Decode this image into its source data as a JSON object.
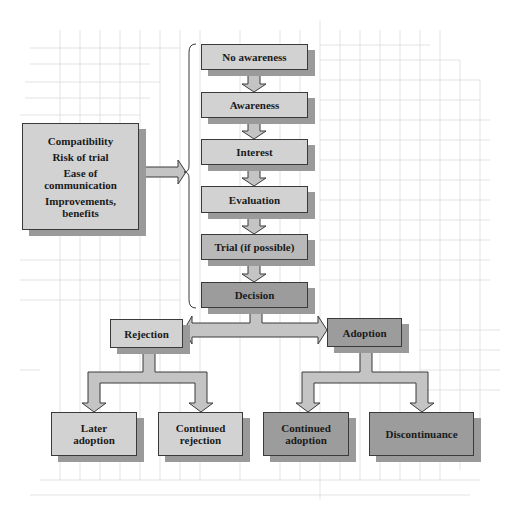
{
  "diagram": {
    "type": "flowchart",
    "factors_box": {
      "items": [
        "Compatibility",
        "Risk of trial",
        "Ease of communication",
        "Improvements, benefits"
      ],
      "lines": [
        "Compatibility",
        "Risk of trial",
        "Ease of",
        "communication",
        "Improvements,",
        "benefits"
      ]
    },
    "stages": [
      {
        "label": "No awareness"
      },
      {
        "label": "Awareness"
      },
      {
        "label": "Interest"
      },
      {
        "label": "Evaluation"
      },
      {
        "label": "Trial (if possible)"
      },
      {
        "label": "Decision"
      }
    ],
    "outcomes": {
      "rejection": {
        "label": "Rejection"
      },
      "adoption": {
        "label": "Adoption"
      }
    },
    "results": {
      "later_adoption": {
        "lines": [
          "Later",
          "adoption"
        ]
      },
      "continued_rejection": {
        "lines": [
          "Continued",
          "rejection"
        ]
      },
      "continued_adoption": {
        "lines": [
          "Continued",
          "adoption"
        ]
      },
      "discontinuance": {
        "lines": [
          "Discontinuance"
        ]
      }
    },
    "edges": [
      {
        "from": "factors_box",
        "to": "stages (bracket)"
      },
      {
        "from": "No awareness",
        "to": "Awareness"
      },
      {
        "from": "Awareness",
        "to": "Interest"
      },
      {
        "from": "Interest",
        "to": "Evaluation"
      },
      {
        "from": "Evaluation",
        "to": "Trial (if possible)"
      },
      {
        "from": "Trial (if possible)",
        "to": "Decision"
      },
      {
        "from": "Decision",
        "to": "Rejection"
      },
      {
        "from": "Decision",
        "to": "Adoption"
      },
      {
        "from": "Rejection",
        "to": "Later adoption"
      },
      {
        "from": "Rejection",
        "to": "Continued rejection"
      },
      {
        "from": "Adoption",
        "to": "Continued adoption"
      },
      {
        "from": "Adoption",
        "to": "Discontinuance"
      }
    ],
    "colors": {
      "box_light": "#d2d2d2",
      "box_mid": "#b9b9b9",
      "box_dark": "#9c9c9c",
      "arrow_fill": "#c4c4c4",
      "shadow": "#9a9a9a",
      "grid": "#d8d8d8",
      "border": "#3a3a3a"
    }
  }
}
